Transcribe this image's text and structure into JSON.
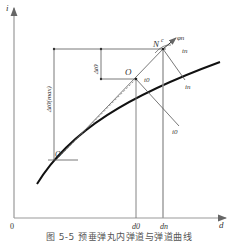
{
  "diagram": {
    "axes": {
      "y_label": "i",
      "x_label": "d",
      "origin_label": "0"
    },
    "points": {
      "N": "N",
      "N_sup": "c",
      "O": "O",
      "O_prime": "O'"
    },
    "labels": {
      "phi_n": "φn",
      "t_n": "tn",
      "i_n": "in",
      "t_0": "t0",
      "i_0": "i0",
      "delta_t0": "Δt0",
      "delta_t0_max": "Δt0(max)",
      "d_0": "d0",
      "d_n": "dn"
    },
    "caption": "图 5-5  预垂弹丸内弹道与弹道曲线"
  },
  "colors": {
    "axis": "#888888",
    "curve": "#111111",
    "line": "#555555",
    "dashed": "#666666"
  }
}
